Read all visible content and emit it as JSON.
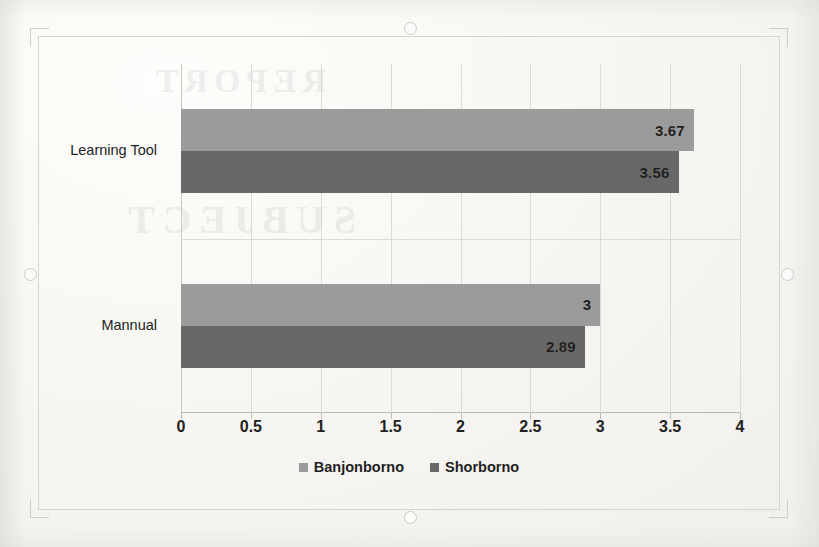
{
  "chart_data": {
    "type": "bar",
    "orientation": "horizontal",
    "title": "",
    "xlabel": "",
    "ylabel": "",
    "categories": [
      "Learning Tool",
      "Mannual"
    ],
    "series": [
      {
        "name": "Banjonborno",
        "color": "#9b9b9b",
        "values": [
          3.67,
          3
        ]
      },
      {
        "name": "Shorborno",
        "color": "#686868",
        "values": [
          3.56,
          2.89
        ]
      }
    ],
    "data_labels": [
      {
        "category": "Learning Tool",
        "series": "Banjonborno",
        "value": 3.67,
        "text": "3.67"
      },
      {
        "category": "Learning Tool",
        "series": "Shorborno",
        "value": 3.56,
        "text": "3.56"
      },
      {
        "category": "Mannual",
        "series": "Banjonborno",
        "value": 3,
        "text": "3"
      },
      {
        "category": "Mannual",
        "series": "Shorborno",
        "value": 2.89,
        "text": "2.89"
      }
    ],
    "xlim": [
      0,
      4
    ],
    "xticks": [
      0,
      0.5,
      1,
      1.5,
      2,
      2.5,
      3,
      3.5,
      4
    ],
    "xtick_labels": [
      "0",
      "0.5",
      "1",
      "1.5",
      "2",
      "2.5",
      "3",
      "3.5",
      "4"
    ],
    "grid": {
      "vertical": true,
      "horizontal": true,
      "color": "#dcdad5"
    },
    "legend": {
      "position": "bottom",
      "entries": [
        "Banjonborno",
        "Shorborno"
      ]
    }
  },
  "legend": {
    "entries": [
      {
        "label": "Banjonborno",
        "marker": "square-swatch-light"
      },
      {
        "label": "Shorborno",
        "marker": "square-swatch-dark"
      }
    ]
  },
  "selection": {
    "handles": [
      "top-middle-handle",
      "bottom-middle-handle",
      "left-middle-handle",
      "right-middle-handle"
    ]
  },
  "bleed_text": {
    "line_a": "REPORT",
    "line_b": "SUBJECT"
  },
  "colors": {
    "series_light": "#9b9b9b",
    "series_dark": "#686868",
    "grid": "#dcdad5",
    "axis": "#b9b7b2",
    "paper": "#f8f7f4",
    "text": "#1f1f1f"
  }
}
